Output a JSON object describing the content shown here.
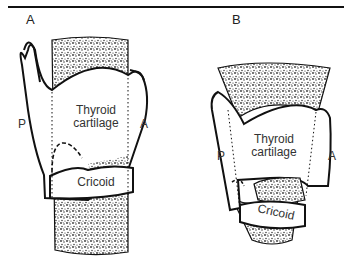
{
  "figure": {
    "panels": [
      {
        "id": "A",
        "label": "A",
        "labels": {
          "posterior": "P",
          "anterior_top": "A",
          "anterior": "A",
          "thyroid_line1": "Thyroid",
          "thyroid_line2": "cartilage",
          "cricoid": "Cricoid"
        }
      },
      {
        "id": "B",
        "label": "B",
        "labels": {
          "posterior": "P",
          "anterior": "A",
          "thyroid_line1": "Thyroid",
          "thyroid_line2": "cartilage",
          "cricoid": "Cricoid"
        }
      }
    ],
    "colors": {
      "outline": "#111111",
      "stipple": "#444444",
      "background": "#ffffff"
    }
  }
}
